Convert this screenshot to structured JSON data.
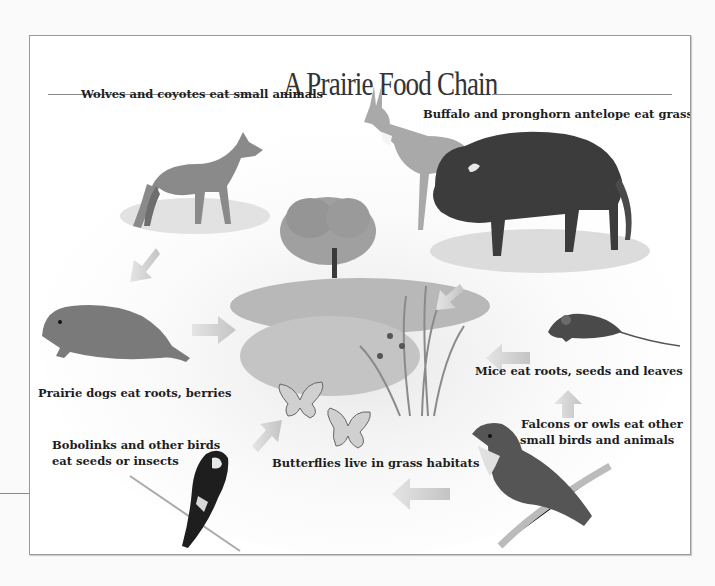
{
  "title": "A Prairie Food Chain",
  "labels": {
    "wolves": "Wolves and coyotes eat small animals",
    "buffalo": "Buffalo and pronghorn antelope eat grass",
    "prairie_dogs": "Prairie dogs eat roots, berries",
    "mice": "Mice eat roots, seeds and leaves",
    "bobolinks_line1": "Bobolinks and other birds",
    "bobolinks_line2": "eat seeds or insects",
    "butterflies": "Butterflies live in grass habitats",
    "falcons_line1": "Falcons or owls eat other",
    "falcons_line2": "small birds and animals"
  },
  "nodes": [
    {
      "id": "coyote",
      "icon": "coyote-icon"
    },
    {
      "id": "pronghorn",
      "icon": "pronghorn-icon"
    },
    {
      "id": "buffalo",
      "icon": "buffalo-icon"
    },
    {
      "id": "tree",
      "icon": "tree-icon"
    },
    {
      "id": "grass",
      "icon": "grass-plants-icon"
    },
    {
      "id": "prairie-dog",
      "icon": "prairie-dog-icon"
    },
    {
      "id": "mouse",
      "icon": "mouse-icon"
    },
    {
      "id": "butterflies",
      "icon": "butterfly-icon"
    },
    {
      "id": "bobolink",
      "icon": "bobolink-icon"
    },
    {
      "id": "falcon",
      "icon": "falcon-icon"
    }
  ],
  "colors": {
    "arrow": "#c8c8c8",
    "ink": "#1e1e1e",
    "frame": "#9a9a9a"
  }
}
